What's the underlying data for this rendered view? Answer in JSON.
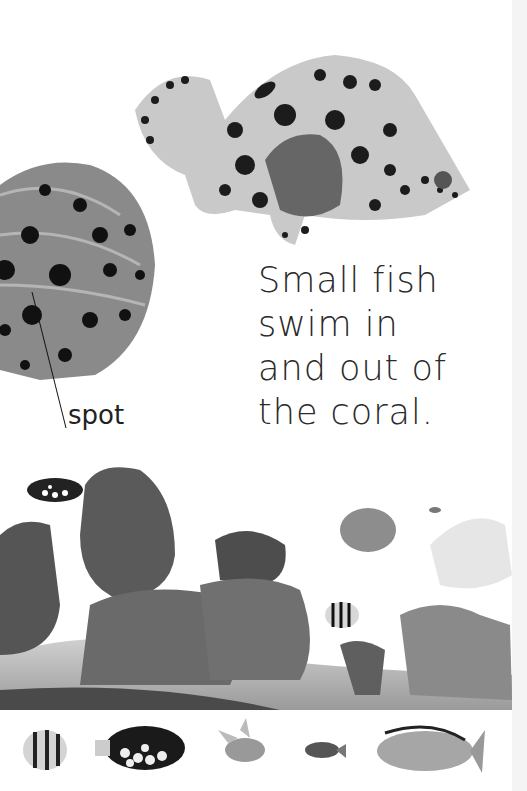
{
  "page": {
    "text_lines": [
      "Small fish",
      "swim in",
      "and out of",
      "the coral."
    ],
    "label": "spot",
    "images": {
      "top_fish": "spotted-grouper-fish",
      "closeup": "spotted-fin-closeup",
      "reef": "coral-reef-scene",
      "strip": [
        "striped-butterflyfish",
        "clown-triggerfish",
        "pajama-cardinalfish",
        "small-dark-fish",
        "unicornfish"
      ]
    },
    "colors": {
      "text": "#2a2a2a",
      "background": "#ffffff"
    }
  }
}
